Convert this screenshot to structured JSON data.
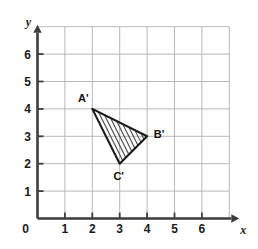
{
  "figure": {
    "axis_labels": {
      "x": "x",
      "y": "y"
    },
    "origin_label": "0",
    "x_ticks": [
      "1",
      "2",
      "3",
      "4",
      "5",
      "6"
    ],
    "y_ticks": [
      "1",
      "2",
      "3",
      "4",
      "5",
      "6"
    ],
    "colors": {
      "grid": "#b8b8b8",
      "axis": "#3d3d3d",
      "shape_stroke": "#1a1a1a",
      "hatch": "#4a4a4a",
      "text": "#1a1a1a",
      "background": "#ffffff"
    }
  },
  "chart_data": {
    "type": "scatter",
    "title": "",
    "xlabel": "x",
    "ylabel": "y",
    "xlim": [
      0,
      7
    ],
    "ylim": [
      0,
      7
    ],
    "xticks": [
      0,
      1,
      2,
      3,
      4,
      5,
      6
    ],
    "yticks": [
      0,
      1,
      2,
      3,
      4,
      5,
      6
    ],
    "grid": true,
    "legend": "none",
    "annotations": [
      {
        "label": "A'",
        "x": 2,
        "y": 4,
        "position": "above-left"
      },
      {
        "label": "B'",
        "x": 4,
        "y": 3,
        "position": "right"
      },
      {
        "label": "C'",
        "x": 3,
        "y": 2,
        "position": "below"
      }
    ],
    "shapes": [
      {
        "name": "triangle-a-prime-b-prime-c-prime",
        "kind": "polygon",
        "fill": "hatched",
        "hatch_pattern": "parallel-diagonal",
        "hatch_line_count": 8,
        "vertices": [
          {
            "label": "A'",
            "x": 2,
            "y": 4
          },
          {
            "label": "B'",
            "x": 4,
            "y": 3
          },
          {
            "label": "C'",
            "x": 3,
            "y": 2
          }
        ]
      }
    ]
  }
}
